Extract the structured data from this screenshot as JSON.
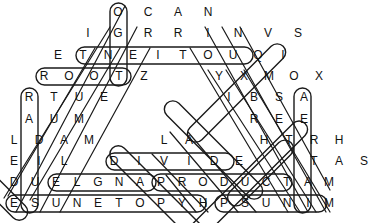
{
  "puzzle": {
    "type": "word-search",
    "shape": "triangle-pyramid",
    "title": "Math Word Search Puzzle",
    "rows": [
      {
        "index": 1,
        "y": 12,
        "start_x": 118,
        "step": 30,
        "letters": [
          "O",
          "C",
          "A",
          "N"
        ]
      },
      {
        "index": 2,
        "y": 33,
        "start_x": 88,
        "step": 30,
        "letters": [
          "I",
          "G",
          "R",
          "R",
          "I",
          "N",
          "V",
          "S"
        ]
      },
      {
        "index": 3,
        "y": 55,
        "start_x": 58,
        "step": 25,
        "letters": [
          "E",
          "T",
          "N",
          "E",
          "I",
          "T",
          "O",
          "U",
          "Q",
          "I"
        ]
      },
      {
        "index": 4,
        "y": 76,
        "start_x": 44,
        "step": 25,
        "letters": [
          "R",
          "O",
          "O",
          "T",
          "Z",
          "",
          "",
          "Y",
          "X",
          "M",
          "O",
          "X"
        ]
      },
      {
        "index": 5,
        "y": 97,
        "start_x": 29,
        "step": 25,
        "letters": [
          "R",
          "T",
          "U",
          "E",
          "",
          "",
          "",
          "",
          "I",
          "B",
          "S",
          "A"
        ]
      },
      {
        "index": 6,
        "y": 119,
        "start_x": 29,
        "step": 25,
        "letters": [
          "A",
          "U",
          "M",
          "",
          "",
          "",
          "",
          "",
          "",
          "R",
          "E",
          "E"
        ]
      },
      {
        "index": 7,
        "y": 140,
        "start_x": 14,
        "step": 25,
        "letters": [
          "L",
          "D",
          "A",
          "M",
          "",
          "",
          "L",
          "A",
          "",
          "",
          "H",
          "T",
          "R",
          "H"
        ]
      },
      {
        "index": 8,
        "y": 161,
        "start_x": 14,
        "step": 25,
        "letters": [
          "E",
          "I",
          "L",
          "",
          "D",
          "I",
          "V",
          "I",
          "D",
          "E",
          "",
          "",
          "T",
          "A",
          "S"
        ]
      },
      {
        "index": 9,
        "y": 182,
        "start_x": 14,
        "step": 21,
        "letters": [
          "D",
          "U",
          "E",
          "L",
          "G",
          "N",
          "A",
          "P",
          "R",
          "O",
          "D",
          "U",
          "C",
          "T",
          "A",
          "M"
        ]
      },
      {
        "index": 10,
        "y": 203,
        "start_x": 14,
        "step": 21,
        "letters": [
          "E",
          "S",
          "U",
          "N",
          "E",
          "T",
          "O",
          "P",
          "Y",
          "H",
          "P",
          "S",
          "U",
          "N",
          "I",
          "M"
        ]
      }
    ],
    "found_words": [
      {
        "word": "ROOT",
        "direction": "horizontal"
      },
      {
        "word": "DIVIDE",
        "direction": "horizontal"
      },
      {
        "word": "ANGLE",
        "direction": "horizontal-reverse"
      },
      {
        "word": "PRODUCT",
        "direction": "horizontal"
      },
      {
        "word": "MINUS",
        "direction": "horizontal-reverse"
      },
      {
        "word": "EQUATION",
        "direction": "horizontal-reverse"
      },
      {
        "word": "OCTAGON",
        "direction": "vertical"
      },
      {
        "word": "RADIUS",
        "direction": "vertical"
      },
      {
        "word": "AVERAGE",
        "direction": "vertical"
      },
      {
        "word": "TRIANGLE",
        "direction": "diagonal"
      },
      {
        "word": "HYPOTENUSE",
        "direction": "diagonal"
      },
      {
        "word": "MAXIMUM",
        "direction": "diagonal"
      },
      {
        "word": "AREA",
        "direction": "diagonal"
      },
      {
        "word": "SQUARE",
        "direction": "diagonal"
      },
      {
        "word": "LENGTH",
        "direction": "diagonal"
      },
      {
        "word": "SUBTRACT",
        "direction": "diagonal"
      }
    ]
  },
  "style": {
    "letter_color": "#121212",
    "circle_color": "#1a1a1a",
    "background": "#ffffff"
  }
}
